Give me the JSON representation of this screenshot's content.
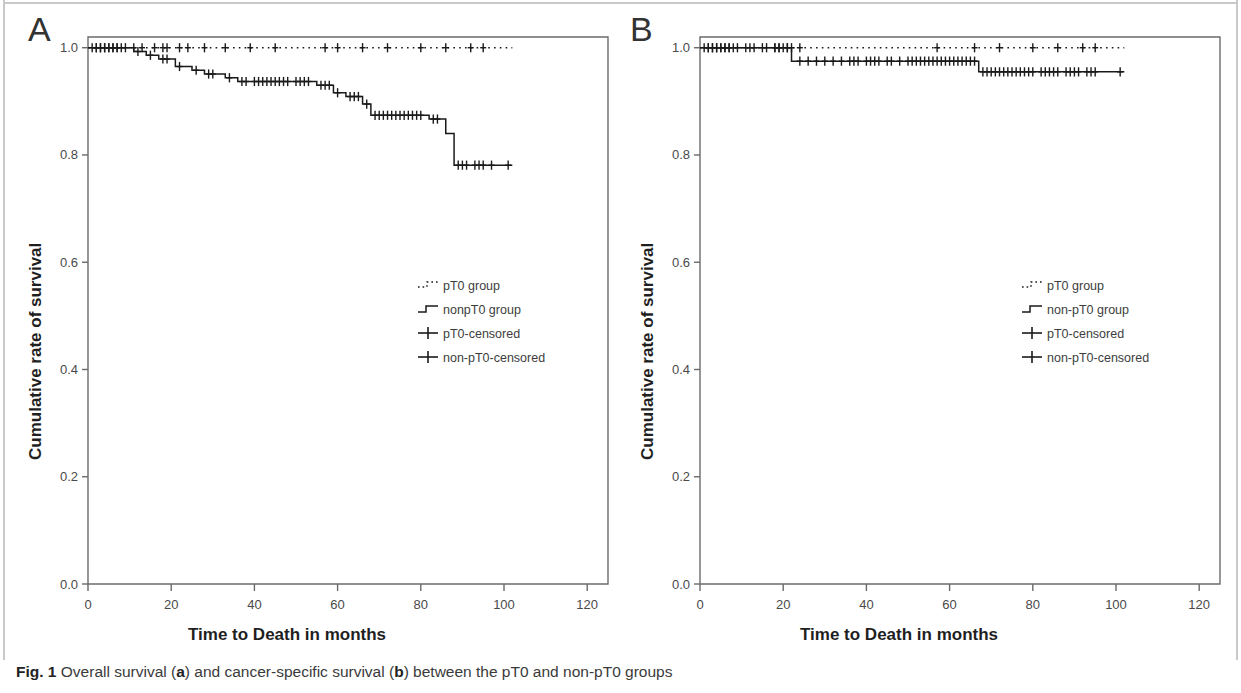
{
  "figure": {
    "caption_prefix": "Fig. 1",
    "caption_text": " Overall survival (",
    "caption_a": "a",
    "caption_mid": ") and cancer-specific survival (",
    "caption_b": "b",
    "caption_end": ") between the pT0 and non-pT0 groups",
    "caption_full": "Fig. 1 Overall survival (a) and cancer-specific survival (b) between the pT0 and non-pT0 groups"
  },
  "panels": [
    {
      "letter": "A",
      "xlabel": "Time to Death in months",
      "ylabel": "Cumulative rate of survival",
      "legend": [
        "pT0 group",
        "nonpT0 group",
        "pT0-censored",
        "non-pT0-censored"
      ]
    },
    {
      "letter": "B",
      "xlabel": "Time to Death in months",
      "ylabel": "Cumulative rate of survival",
      "legend": [
        "pT0 group",
        "non-pT0 group",
        "pT0-censored",
        "non-pT0-censored"
      ]
    }
  ],
  "chart_data": [
    {
      "type": "line",
      "subtype": "kaplan-meier-step",
      "panel": "A",
      "title": "Overall survival",
      "xlabel": "Time to Death in months",
      "ylabel": "Cumulative rate of survival",
      "xlim": [
        0,
        125
      ],
      "ylim": [
        0.0,
        1.02
      ],
      "xticks": [
        0,
        20,
        40,
        60,
        80,
        100,
        120
      ],
      "yticks": [
        0.0,
        0.2,
        0.4,
        0.6,
        0.8,
        1.0
      ],
      "ytick_labels": [
        "0.0",
        "0.2",
        "0.4",
        "0.6",
        "0.8",
        "1.0"
      ],
      "xtick_labels": [
        "0",
        "20",
        "40",
        "60",
        "80",
        "100",
        "120"
      ],
      "grid": false,
      "legend_position": "center",
      "series": [
        {
          "name": "pT0 group",
          "style": "dotted",
          "color": "#1a1a1a",
          "steps": [
            {
              "t": 0,
              "s": 1.0
            },
            {
              "t": 102,
              "s": 1.0
            }
          ],
          "censored": [
            1,
            2,
            3,
            4,
            5,
            6,
            7,
            9,
            11,
            13,
            16,
            18,
            19,
            22,
            24,
            28,
            33,
            39,
            45,
            57,
            60,
            66,
            72,
            80,
            86,
            92,
            95
          ]
        },
        {
          "name": "nonpT0 group",
          "style": "solid",
          "color": "#1a1a1a",
          "steps": [
            {
              "t": 0,
              "s": 1.0
            },
            {
              "t": 11,
              "s": 0.993
            },
            {
              "t": 14,
              "s": 0.986
            },
            {
              "t": 17,
              "s": 0.979
            },
            {
              "t": 21,
              "s": 0.965
            },
            {
              "t": 25,
              "s": 0.958
            },
            {
              "t": 28,
              "s": 0.951
            },
            {
              "t": 33,
              "s": 0.944
            },
            {
              "t": 36,
              "s": 0.937
            },
            {
              "t": 55,
              "s": 0.93
            },
            {
              "t": 59,
              "s": 0.916
            },
            {
              "t": 62,
              "s": 0.909
            },
            {
              "t": 66,
              "s": 0.895
            },
            {
              "t": 68,
              "s": 0.874
            },
            {
              "t": 82,
              "s": 0.867
            },
            {
              "t": 86,
              "s": 0.84
            },
            {
              "t": 88,
              "s": 0.781
            },
            {
              "t": 102,
              "s": 0.781
            }
          ],
          "censored": [
            2,
            3,
            4,
            5,
            6,
            7,
            8,
            12,
            15,
            18,
            19,
            22,
            26,
            29,
            30,
            34,
            37,
            38,
            40,
            41,
            42,
            43,
            44,
            45,
            46,
            47,
            48,
            50,
            51,
            52,
            53,
            56,
            57,
            58,
            60,
            63,
            64,
            65,
            67,
            69,
            70,
            71,
            72,
            73,
            74,
            75,
            76,
            77,
            78,
            79,
            80,
            83,
            84,
            89,
            90,
            91,
            93,
            94,
            95,
            97,
            101
          ]
        }
      ]
    },
    {
      "type": "line",
      "subtype": "kaplan-meier-step",
      "panel": "B",
      "title": "Cancer-specific survival",
      "xlabel": "Time to Death in months",
      "ylabel": "Cumulative rate of survival",
      "xlim": [
        0,
        125
      ],
      "ylim": [
        0.0,
        1.02
      ],
      "xticks": [
        0,
        20,
        40,
        60,
        80,
        100,
        120
      ],
      "yticks": [
        0.0,
        0.2,
        0.4,
        0.6,
        0.8,
        1.0
      ],
      "ytick_labels": [
        "0.0",
        "0.2",
        "0.4",
        "0.6",
        "0.8",
        "1.0"
      ],
      "xtick_labels": [
        "0",
        "20",
        "40",
        "60",
        "80",
        "100",
        "120"
      ],
      "grid": false,
      "legend_position": "center",
      "series": [
        {
          "name": "pT0 group",
          "style": "dotted",
          "color": "#1a1a1a",
          "steps": [
            {
              "t": 0,
              "s": 1.0
            },
            {
              "t": 102,
              "s": 1.0
            }
          ],
          "censored": [
            1,
            2,
            3,
            4,
            5,
            6,
            7,
            9,
            11,
            13,
            16,
            18,
            19,
            21,
            22,
            24,
            57,
            66,
            72,
            80,
            86,
            92,
            95
          ]
        },
        {
          "name": "non-pT0 group",
          "style": "solid",
          "color": "#1a1a1a",
          "steps": [
            {
              "t": 0,
              "s": 1.0
            },
            {
              "t": 22,
              "s": 0.975
            },
            {
              "t": 67,
              "s": 0.955
            },
            {
              "t": 102,
              "s": 0.955
            }
          ],
          "censored": [
            2,
            3,
            4,
            5,
            6,
            7,
            8,
            12,
            15,
            18,
            19,
            20,
            21,
            24,
            26,
            28,
            30,
            32,
            34,
            36,
            37,
            38,
            40,
            41,
            42,
            43,
            45,
            46,
            48,
            50,
            51,
            52,
            53,
            54,
            55,
            56,
            57,
            58,
            59,
            60,
            61,
            62,
            63,
            64,
            65,
            66,
            68,
            69,
            70,
            71,
            72,
            73,
            74,
            75,
            76,
            77,
            78,
            79,
            80,
            82,
            83,
            84,
            85,
            86,
            88,
            89,
            90,
            91,
            93,
            94,
            95,
            101
          ]
        }
      ]
    }
  ]
}
